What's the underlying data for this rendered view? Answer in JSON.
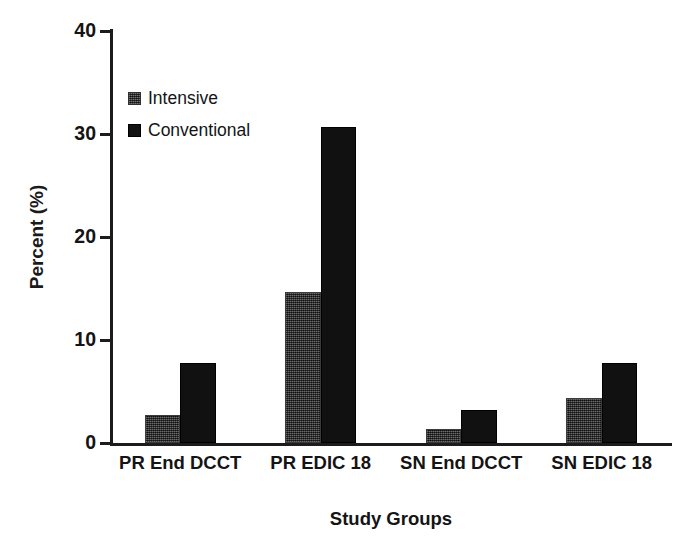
{
  "chart_data": {
    "type": "bar",
    "title": "",
    "xlabel": "Study Groups",
    "ylabel": "Percent (%)",
    "categories": [
      "PR End DCCT",
      "PR EDIC 18",
      "SN End DCCT",
      "SN EDIC 18"
    ],
    "series": [
      {
        "name": "Intensive",
        "color": "#4d4d4d",
        "values": [
          2.7,
          14.7,
          1.4,
          4.4
        ]
      },
      {
        "name": "Conventional",
        "color": "#111111",
        "values": [
          7.8,
          30.7,
          3.2,
          7.8
        ]
      }
    ],
    "ylim": [
      0,
      40
    ],
    "yticks": [
      0,
      10,
      20,
      30,
      40
    ],
    "ytick_labels": [
      "0",
      "10",
      "20",
      "30",
      "40"
    ],
    "grid": false,
    "legend_position": "upper left inside"
  },
  "axes": {
    "y_title": "Percent (%)",
    "x_title": "Study Groups",
    "y_tick_labels": [
      "40",
      "30",
      "20",
      "10",
      "0"
    ]
  },
  "legend": {
    "items": [
      {
        "label": "Intensive",
        "swatch": "gray-square-icon"
      },
      {
        "label": "Conventional",
        "swatch": "black-square-icon"
      }
    ]
  },
  "caption_sliver": " "
}
